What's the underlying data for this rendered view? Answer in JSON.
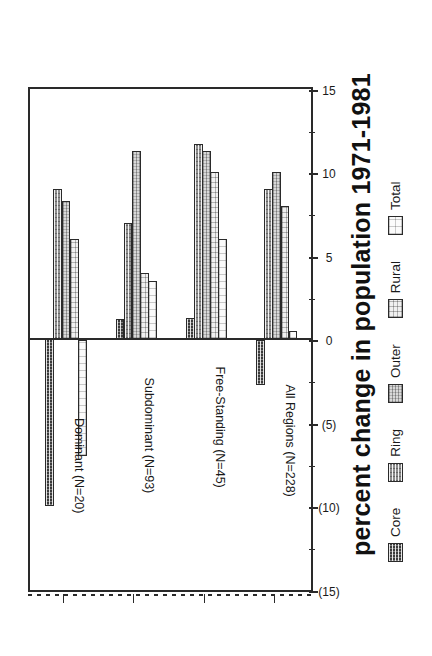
{
  "chart_data": {
    "type": "bar",
    "title": "",
    "xlabel": "",
    "ylabel": "percent change in population 1971-1981",
    "orientation": "vertical-bars-rotated-90",
    "grid": true,
    "legend_position": "bottom",
    "ylim": [
      -15,
      15
    ],
    "yticks": [
      -15,
      -10,
      -5,
      0,
      5,
      10,
      15
    ],
    "ytick_labels": [
      "(15)",
      "(10)",
      "(5)",
      "0",
      "5",
      "10",
      "15"
    ],
    "minor_ticks": [
      -12.5,
      -7.5,
      -2.5,
      2.5,
      7.5,
      12.5
    ],
    "gridlines_at": [
      -10,
      -5,
      5,
      10
    ],
    "categories": [
      "Dominant (N=20)",
      "Subdominant (N=93)",
      "Free-Standing (N=45)",
      "All Regions (N=228)"
    ],
    "series": [
      {
        "name": "Core",
        "values": [
          -10.0,
          1.2,
          1.3,
          -2.7
        ]
      },
      {
        "name": "Ring",
        "values": [
          9.0,
          7.0,
          11.7,
          9.0
        ]
      },
      {
        "name": "Outer",
        "values": [
          8.3,
          11.3,
          11.3,
          10.0
        ]
      },
      {
        "name": "Rural",
        "values": [
          6.0,
          4.0,
          10.0,
          8.0
        ]
      },
      {
        "name": "Total",
        "values": [
          -7.0,
          3.5,
          6.0,
          0.5
        ]
      }
    ]
  },
  "axis": {
    "value_axis_title": "percent change in population 1971-1981",
    "tick_labels": [
      "(15)",
      "(10)",
      "(5)",
      "0",
      "5",
      "10",
      "15"
    ]
  },
  "legend": {
    "items": [
      {
        "label": "Core",
        "pattern": "dense-dark-crosshatch",
        "color": "#3a3a3a"
      },
      {
        "label": "Ring",
        "pattern": "medium-grey-hatch",
        "color": "#8d8d8d"
      },
      {
        "label": "Outer",
        "pattern": "light-grey-stipple",
        "color": "#d8d8d8"
      },
      {
        "label": "Rural",
        "pattern": "fine-dot-stipple",
        "color": "#f0f0f0"
      },
      {
        "label": "Total",
        "pattern": "sparse-dot-outline",
        "color": "#fbfbfb"
      }
    ]
  },
  "categories": [
    {
      "label": "Dominant (N=20)"
    },
    {
      "label": "Subdominant (N=93)"
    },
    {
      "label": "Free-Standing (N=45)"
    },
    {
      "label": "All Regions (N=228)"
    }
  ]
}
